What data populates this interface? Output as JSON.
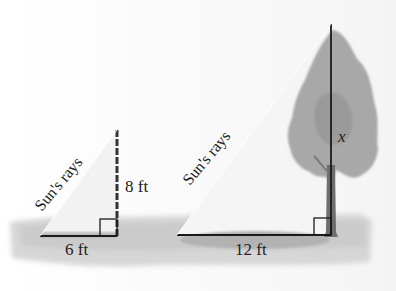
{
  "figure": {
    "left_triangle": {
      "hypotenuse_label": "Sun's rays",
      "height_label": "8 ft",
      "base_label": "6 ft",
      "object": "pole"
    },
    "right_triangle": {
      "hypotenuse_label": "Sun's rays",
      "height_label": "x",
      "base_label": "12 ft",
      "object": "tree"
    }
  },
  "colors": {
    "line": "#1a1a1a",
    "ground": "#cfcfcf",
    "shadow": "#b4b4b4",
    "foliage": "#a9a9a9",
    "trunk": "#6e6e6e",
    "ray_fill": "#f3f3f3"
  }
}
